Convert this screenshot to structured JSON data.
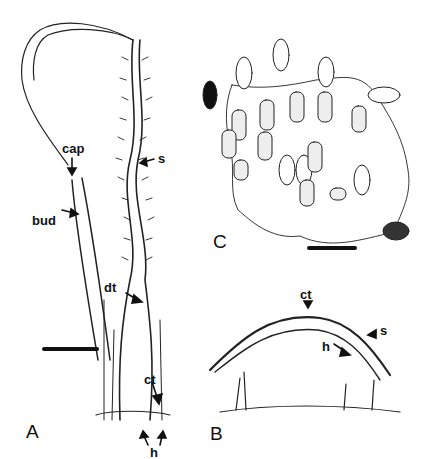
{
  "figure": {
    "panels": [
      {
        "id": "A",
        "label": "A",
        "labels": [
          "cap",
          "bud",
          "s",
          "dt",
          "ct",
          "h"
        ]
      },
      {
        "id": "B",
        "label": "B",
        "labels": [
          "ct",
          "s",
          "h"
        ]
      },
      {
        "id": "C",
        "label": "C",
        "labels": []
      }
    ],
    "labels": {
      "cap": "cap",
      "bud": "bud",
      "s_a": "s",
      "dt": "dt",
      "ct_a": "ct",
      "h_a": "h",
      "ct_b": "ct",
      "s_b": "s",
      "h_b": "h",
      "panel_a": "A",
      "panel_b": "B",
      "panel_c": "C"
    }
  }
}
